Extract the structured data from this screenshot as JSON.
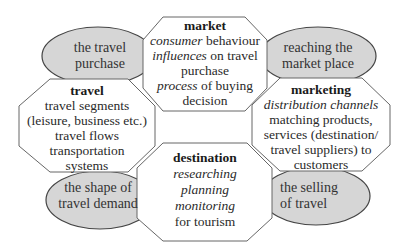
{
  "colors": {
    "ellipse_fill": "#d6d6d6",
    "stroke": "#555555",
    "octagon_fill": "#ffffff"
  },
  "ellipses": {
    "top_left": {
      "lines": [
        "the travel",
        "purchase"
      ]
    },
    "top_right": {
      "lines": [
        "reaching the",
        "market place"
      ]
    },
    "bottom_left": {
      "lines": [
        "the shape of",
        "travel demand"
      ]
    },
    "bottom_right": {
      "lines": [
        "the selling",
        "of travel"
      ]
    }
  },
  "octagons": {
    "market": {
      "title": "market",
      "l1_i": "consumer",
      "l1_r": " behaviour",
      "l2_i": "influences",
      "l2_r": " on travel",
      "l3": "purchase",
      "l4_i": "process",
      "l4_r": " of buying",
      "l5": "decision"
    },
    "travel": {
      "title": "travel",
      "lines": [
        "travel segments",
        "(leisure, business etc.)",
        "travel flows",
        "transportation",
        "systems"
      ]
    },
    "marketing": {
      "title": "marketing",
      "l1_i": "distribution channels",
      "lines": [
        "matching products,",
        "services (destination/",
        "travel suppliers) to",
        "customers"
      ]
    },
    "destination": {
      "title": "destination",
      "italic_lines": [
        "researching",
        "planning",
        "monitoring"
      ],
      "l_last": "for tourism"
    }
  }
}
